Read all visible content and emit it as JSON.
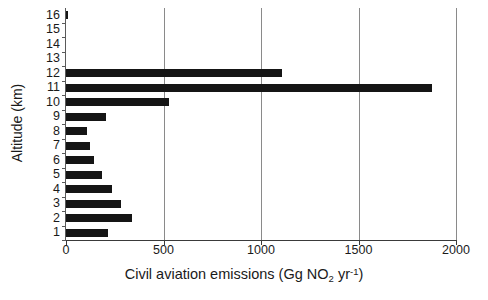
{
  "chart_data": {
    "type": "bar",
    "orientation": "horizontal",
    "title": "",
    "xlabel": "Civil aviation emissions (Gg NO2 yr-1)",
    "xlabel_parts": {
      "prefix": "Civil aviation emissions (Gg NO",
      "sub": "2",
      "middle": " yr",
      "sup": "-1",
      "suffix": ")"
    },
    "ylabel": "Altitude (km)",
    "categories": [
      "1",
      "2",
      "3",
      "4",
      "5",
      "6",
      "7",
      "8",
      "9",
      "10",
      "11",
      "12",
      "13",
      "14",
      "15",
      "16"
    ],
    "values": [
      216,
      338,
      282,
      236,
      185,
      144,
      123,
      108,
      205,
      528,
      1877,
      1108,
      0,
      0,
      0,
      10
    ],
    "xlim": [
      0,
      2000
    ],
    "xticks": [
      0,
      500,
      1000,
      1500,
      2000
    ],
    "xtick_labels": [
      "0",
      "500",
      "1000",
      "1500",
      "2000"
    ],
    "ytick_labels": [
      "16",
      "15",
      "14",
      "13",
      "12",
      "11",
      "10",
      "9",
      "8",
      "7",
      "6",
      "5",
      "4",
      "3",
      "2",
      "1"
    ],
    "grid": "vertical",
    "legend": "none",
    "bar_color": "#151515",
    "grid_color": "#8a8a8a",
    "axis_color": "#3a3a3a"
  }
}
